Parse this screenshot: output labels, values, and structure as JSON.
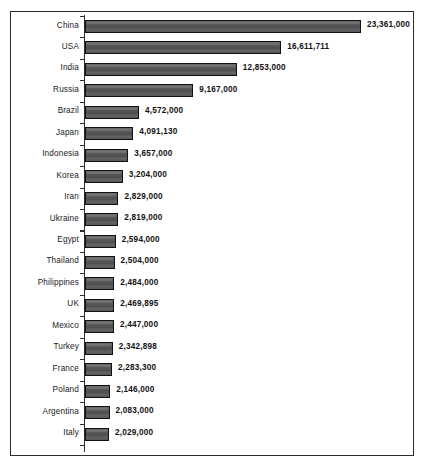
{
  "chart_data": {
    "type": "bar",
    "orientation": "horizontal",
    "title": "",
    "subtitle": "",
    "xlabel": "",
    "ylabel": "",
    "grid": false,
    "legend": "none",
    "xlim": [
      0,
      23361000
    ],
    "categories": [
      "China",
      "USA",
      "India",
      "Russia",
      "Brazil",
      "Japan",
      "Indonesia",
      "Korea",
      "Iran",
      "Ukraine",
      "Egypt",
      "Thailand",
      "Philippines",
      "UK",
      "Mexico",
      "Turkey",
      "France",
      "Poland",
      "Argentina",
      "Italy"
    ],
    "values": [
      23361000,
      16611711,
      12853000,
      9167000,
      4572000,
      4091130,
      3657000,
      3204000,
      2829000,
      2819000,
      2594000,
      2504000,
      2484000,
      2469895,
      2447000,
      2342898,
      2283300,
      2146000,
      2083000,
      2029000
    ],
    "value_labels": [
      "23,361,000",
      "16,611,711",
      "12,853,000",
      "9,167,000",
      "4,572,000",
      "4,091,130",
      "3,657,000",
      "3,204,000",
      "2,829,000",
      "2,819,000",
      "2,594,000",
      "2,504,000",
      "2,484,000",
      "2,469,895",
      "2,447,000",
      "2,342,898",
      "2,283,300",
      "2,146,000",
      "2,083,000",
      "2,029,000"
    ],
    "colors": {
      "bar_fill": "#555555",
      "bar_border": "#111111",
      "axis": "#2b2b2b",
      "frame": "#2b2b2b",
      "text": "#1a1a1a",
      "background": "#ffffff"
    }
  }
}
